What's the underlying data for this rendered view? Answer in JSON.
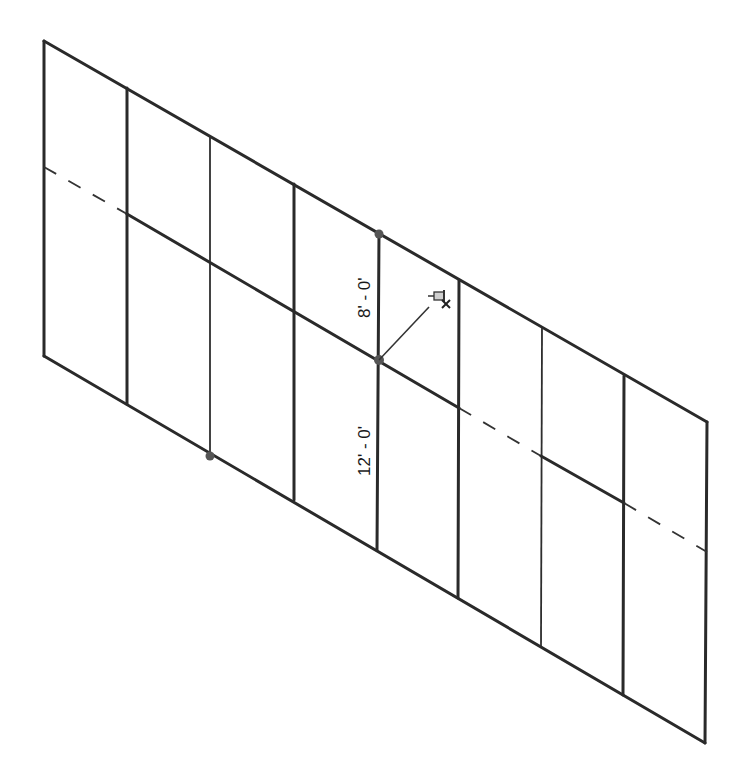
{
  "diagram": {
    "type": "isometric curtain wall grid elevation",
    "dimensions": [
      {
        "id": "upper",
        "label": "8' - 0'"
      },
      {
        "id": "lower",
        "label": "12' - 0'"
      }
    ],
    "icons": {
      "pin": "pushpin-icon"
    },
    "colors": {
      "line": "#2a2a2a",
      "background": "#ffffff",
      "grip": "#555555"
    },
    "columns_x": [
      44,
      127,
      210,
      294,
      379,
      459,
      542,
      624,
      707
    ],
    "columns_top_y": [
      41,
      88,
      136,
      184,
      233,
      280,
      328,
      376,
      422
    ],
    "columns_bottom_y": [
      356,
      404,
      456,
      500,
      550,
      598,
      646,
      695,
      743
    ],
    "column_weights": [
      "thick",
      "thick",
      "thin",
      "thick",
      "thick",
      "thick",
      "thin",
      "thick",
      "thick"
    ]
  }
}
